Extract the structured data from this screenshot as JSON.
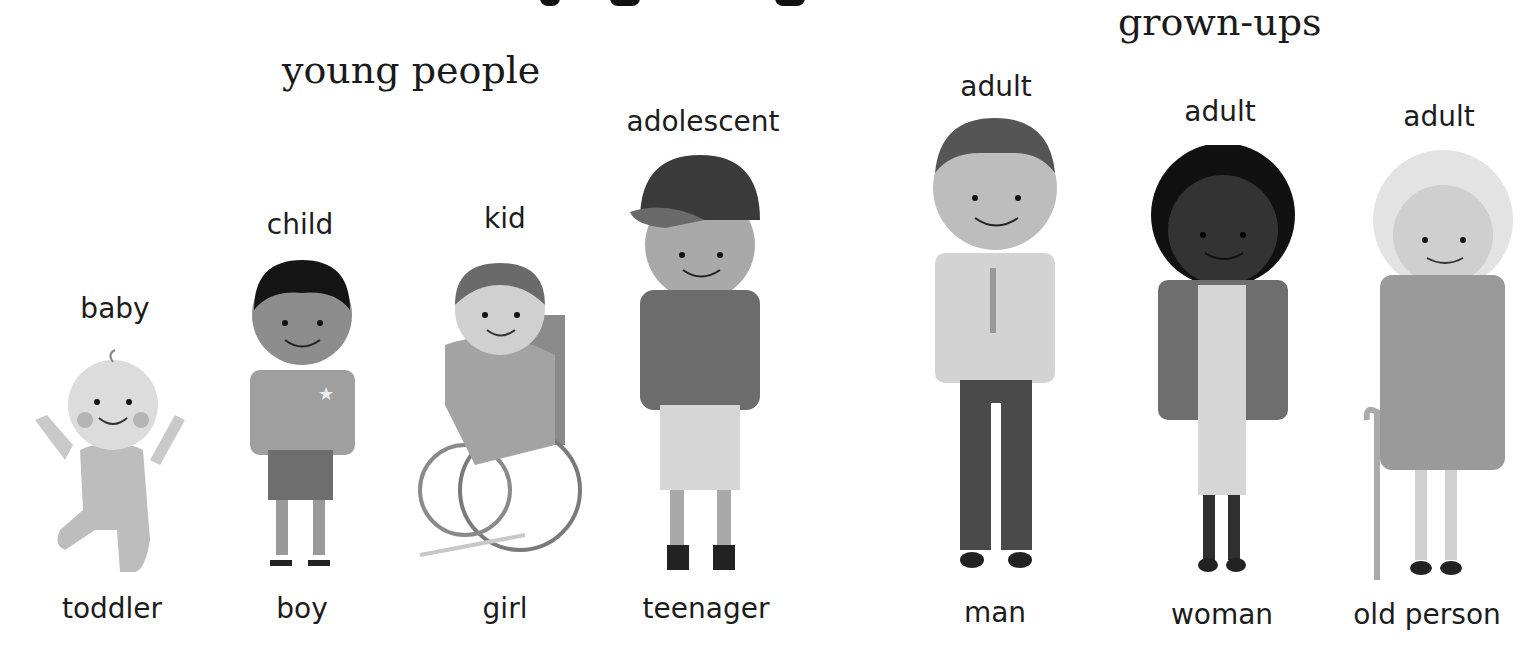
{
  "headings": {
    "young": "young people",
    "grown": "grown-ups"
  },
  "people": [
    {
      "id": "baby",
      "top_label": "baby",
      "bottom_label": "toddler"
    },
    {
      "id": "boy",
      "top_label": "child",
      "bottom_label": "boy"
    },
    {
      "id": "girl",
      "top_label": "kid",
      "bottom_label": "girl"
    },
    {
      "id": "teen",
      "top_label": "adolescent",
      "bottom_label": "teenager"
    },
    {
      "id": "man",
      "top_label": "adult",
      "bottom_label": "man"
    },
    {
      "id": "woman",
      "top_label": "adult",
      "bottom_label": "woman"
    },
    {
      "id": "old",
      "top_label": "adult",
      "bottom_label": "old person"
    }
  ]
}
